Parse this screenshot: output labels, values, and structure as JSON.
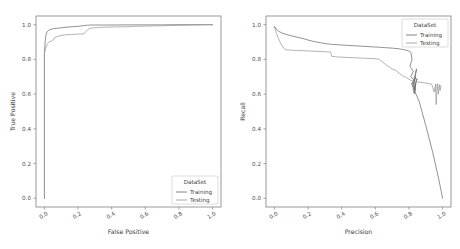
{
  "figure": {
    "background": "#ffffff",
    "panel_count": 2
  },
  "chart_data": [
    {
      "type": "line",
      "title": "",
      "subtitle": "",
      "xlabel": "False Positive",
      "ylabel": "True Positive",
      "xlim": [
        -0.05,
        1.05
      ],
      "ylim": [
        -0.05,
        1.05
      ],
      "xticks": [
        "0.0",
        "0.2",
        "0.4",
        "0.6",
        "0.8",
        "1.0"
      ],
      "xtick_values": [
        0.0,
        0.2,
        0.4,
        0.6,
        0.8,
        1.0
      ],
      "yticks": [
        "0.0",
        "0.2",
        "0.4",
        "0.6",
        "0.8",
        "1.0"
      ],
      "ytick_values": [
        0.0,
        0.2,
        0.4,
        0.6,
        0.8,
        1.0
      ],
      "grid": false,
      "legend_position": "lower right",
      "legend_title": "DataSet",
      "series": [
        {
          "name": "Training",
          "color": "#6e6e6e",
          "x": [
            0.0,
            0.0,
            0.003,
            0.005,
            0.008,
            0.01,
            0.013,
            0.016,
            0.02,
            0.026,
            0.033,
            0.042,
            0.055,
            0.07,
            0.09,
            0.115,
            0.145,
            0.175,
            0.205,
            0.235,
            0.255,
            0.275,
            0.3,
            0.33,
            0.37,
            0.42,
            0.48,
            0.53,
            0.6,
            0.7,
            0.8,
            0.9,
            1.0
          ],
          "y": [
            0.0,
            0.84,
            0.88,
            0.91,
            0.93,
            0.944,
            0.952,
            0.958,
            0.963,
            0.968,
            0.971,
            0.974,
            0.977,
            0.979,
            0.981,
            0.984,
            0.987,
            0.989,
            0.991,
            0.995,
            0.997,
            0.998,
            0.998,
            0.998,
            0.998,
            0.998,
            0.999,
            0.999,
            0.999,
            0.999,
            1.0,
            1.0,
            1.0
          ]
        },
        {
          "name": "Testing",
          "color": "#9a9a9a",
          "x": [
            0.0,
            0.0,
            0.004,
            0.008,
            0.012,
            0.016,
            0.02,
            0.026,
            0.033,
            0.042,
            0.052,
            0.062,
            0.075,
            0.09,
            0.105,
            0.12,
            0.14,
            0.16,
            0.185,
            0.21,
            0.235,
            0.248,
            0.258,
            0.268,
            0.285,
            0.31,
            0.34,
            0.38,
            0.43,
            0.48,
            0.52,
            0.525,
            0.6,
            0.7,
            0.8,
            0.9,
            1.0
          ],
          "y": [
            0.0,
            0.835,
            0.85,
            0.865,
            0.878,
            0.886,
            0.893,
            0.898,
            0.902,
            0.906,
            0.912,
            0.926,
            0.931,
            0.936,
            0.939,
            0.941,
            0.943,
            0.944,
            0.945,
            0.946,
            0.947,
            0.962,
            0.972,
            0.978,
            0.981,
            0.983,
            0.985,
            0.986,
            0.987,
            0.988,
            0.989,
            0.99,
            0.992,
            0.994,
            0.996,
            0.998,
            1.0
          ]
        }
      ]
    },
    {
      "type": "line",
      "title": "",
      "subtitle": "",
      "xlabel": "Precision",
      "ylabel": "Recall",
      "xlim": [
        -0.05,
        1.05
      ],
      "ylim": [
        -0.05,
        1.05
      ],
      "xticks": [
        "0.0",
        "0.2",
        "0.4",
        "0.6",
        "0.8",
        "1.0"
      ],
      "xtick_values": [
        0.0,
        0.2,
        0.4,
        0.6,
        0.8,
        1.0
      ],
      "yticks": [
        "0.0",
        "0.2",
        "0.4",
        "0.6",
        "0.8",
        "1.0"
      ],
      "ytick_values": [
        0.0,
        0.2,
        0.4,
        0.6,
        0.8,
        1.0
      ],
      "grid": false,
      "legend_position": "upper right",
      "legend_title": "DataSet",
      "series": [
        {
          "name": "Training",
          "color": "#6e6e6e",
          "x": [
            0.0,
            0.01,
            0.025,
            0.045,
            0.07,
            0.1,
            0.135,
            0.17,
            0.205,
            0.24,
            0.275,
            0.31,
            0.345,
            0.38,
            0.415,
            0.45,
            0.485,
            0.52,
            0.555,
            0.59,
            0.625,
            0.655,
            0.685,
            0.71,
            0.735,
            0.76,
            0.78,
            0.795,
            0.805,
            0.812,
            0.818,
            0.806,
            0.826,
            0.81,
            0.834,
            0.814,
            0.84,
            0.82,
            0.845,
            0.825,
            0.848,
            0.828,
            0.84,
            0.832,
            0.838,
            0.836,
            0.86,
            0.9,
            0.94,
            0.975,
            1.0
          ],
          "y": [
            0.99,
            0.975,
            0.962,
            0.952,
            0.944,
            0.936,
            0.928,
            0.92,
            0.91,
            0.902,
            0.896,
            0.89,
            0.886,
            0.884,
            0.882,
            0.88,
            0.878,
            0.876,
            0.874,
            0.872,
            0.87,
            0.868,
            0.866,
            0.864,
            0.862,
            0.858,
            0.854,
            0.85,
            0.846,
            0.84,
            0.8,
            0.76,
            0.73,
            0.7,
            0.68,
            0.655,
            0.7,
            0.64,
            0.745,
            0.625,
            0.69,
            0.61,
            0.66,
            0.602,
            0.64,
            0.612,
            0.56,
            0.42,
            0.27,
            0.12,
            0.0
          ]
        },
        {
          "name": "Testing",
          "color": "#9a9a9a",
          "x": [
            0.0,
            0.012,
            0.028,
            0.045,
            0.058,
            0.068,
            0.09,
            0.13,
            0.175,
            0.22,
            0.265,
            0.31,
            0.335,
            0.34,
            0.375,
            0.42,
            0.465,
            0.51,
            0.555,
            0.6,
            0.625,
            0.64,
            0.66,
            0.68,
            0.7,
            0.715,
            0.73,
            0.745,
            0.76,
            0.775,
            0.79,
            0.8,
            0.812,
            0.82,
            0.83,
            0.845,
            0.855,
            0.87,
            0.885,
            0.9,
            0.912,
            0.92,
            0.935,
            0.95,
            0.958,
            0.962,
            0.968,
            0.975,
            0.98,
            0.985,
            0.99
          ],
          "y": [
            0.985,
            0.95,
            0.91,
            0.878,
            0.862,
            0.856,
            0.854,
            0.852,
            0.85,
            0.848,
            0.846,
            0.844,
            0.842,
            0.818,
            0.814,
            0.812,
            0.81,
            0.808,
            0.806,
            0.804,
            0.8,
            0.786,
            0.772,
            0.758,
            0.745,
            0.74,
            0.73,
            0.718,
            0.706,
            0.7,
            0.692,
            0.686,
            0.68,
            0.676,
            0.672,
            0.668,
            0.67,
            0.668,
            0.666,
            0.664,
            0.662,
            0.66,
            0.658,
            0.612,
            0.658,
            0.54,
            0.66,
            0.6,
            0.655,
            0.62,
            0.65
          ]
        }
      ]
    }
  ]
}
